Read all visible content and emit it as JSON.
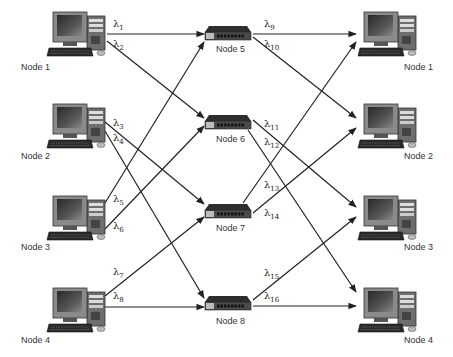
{
  "diagram": {
    "type": "optical-network-wavelength-routing",
    "source_nodes": [
      {
        "id": "src1",
        "label": "Node 1",
        "x": 75,
        "y": 38
      },
      {
        "id": "src2",
        "label": "Node 2",
        "x": 75,
        "y": 130
      },
      {
        "id": "src3",
        "label": "Node 3",
        "x": 75,
        "y": 218
      },
      {
        "id": "src4",
        "label": "Node 4",
        "x": 75,
        "y": 310
      }
    ],
    "switch_nodes": [
      {
        "id": "sw5",
        "label": "Node 5",
        "x": 227,
        "y": 35
      },
      {
        "id": "sw6",
        "label": "Node 6",
        "x": 227,
        "y": 127
      },
      {
        "id": "sw7",
        "label": "Node 7",
        "x": 227,
        "y": 212
      },
      {
        "id": "sw8",
        "label": "Node 8",
        "x": 227,
        "y": 304
      }
    ],
    "dest_nodes": [
      {
        "id": "dst1",
        "label": "Node 1",
        "x": 372,
        "y": 38
      },
      {
        "id": "dst2",
        "label": "Node 2",
        "x": 372,
        "y": 130
      },
      {
        "id": "dst3",
        "label": "Node 3",
        "x": 372,
        "y": 218
      },
      {
        "id": "dst4",
        "label": "Node 4",
        "x": 372,
        "y": 310
      }
    ],
    "links": [
      {
        "from": "src1",
        "to": "sw5",
        "label": "λ",
        "sub": "1",
        "x1": 107,
        "y1": 34,
        "x2": 204,
        "y2": 34,
        "lx": 113,
        "ly": 27
      },
      {
        "from": "src1",
        "to": "sw6",
        "label": "λ",
        "sub": "2",
        "x1": 107,
        "y1": 41,
        "x2": 204,
        "y2": 118,
        "lx": 113,
        "ly": 47
      },
      {
        "from": "src2",
        "to": "sw7",
        "label": "λ",
        "sub": "3",
        "x1": 105,
        "y1": 122,
        "x2": 204,
        "y2": 204,
        "lx": 113,
        "ly": 126
      },
      {
        "from": "src2",
        "to": "sw8",
        "label": "λ",
        "sub": "4",
        "x1": 105,
        "y1": 131,
        "x2": 204,
        "y2": 298,
        "lx": 113,
        "ly": 141
      },
      {
        "from": "src3",
        "to": "sw5",
        "label": "λ",
        "sub": "5",
        "x1": 105,
        "y1": 203,
        "x2": 204,
        "y2": 42,
        "lx": 113,
        "ly": 202
      },
      {
        "from": "src3",
        "to": "sw6",
        "label": "λ",
        "sub": "6",
        "x1": 105,
        "y1": 229,
        "x2": 204,
        "y2": 126,
        "lx": 113,
        "ly": 229
      },
      {
        "from": "src4",
        "to": "sw7",
        "label": "λ",
        "sub": "7",
        "x1": 105,
        "y1": 296,
        "x2": 204,
        "y2": 217,
        "lx": 113,
        "ly": 275
      },
      {
        "from": "src4",
        "to": "sw8",
        "label": "λ",
        "sub": "8",
        "x1": 105,
        "y1": 307,
        "x2": 204,
        "y2": 307,
        "lx": 113,
        "ly": 299
      },
      {
        "from": "sw5",
        "to": "dst1",
        "label": "λ",
        "sub": "9",
        "x1": 253,
        "y1": 34,
        "x2": 356,
        "y2": 34,
        "lx": 264,
        "ly": 27
      },
      {
        "from": "sw5",
        "to": "dst2",
        "label": "λ",
        "sub": "10",
        "x1": 253,
        "y1": 37,
        "x2": 356,
        "y2": 118,
        "lx": 264,
        "ly": 47
      },
      {
        "from": "sw6",
        "to": "dst3",
        "label": "λ",
        "sub": "11",
        "x1": 253,
        "y1": 120,
        "x2": 356,
        "y2": 207,
        "lx": 264,
        "ly": 127
      },
      {
        "from": "sw6",
        "to": "dst4",
        "label": "λ",
        "sub": "12",
        "x1": 248,
        "y1": 130,
        "x2": 356,
        "y2": 292,
        "lx": 264,
        "ly": 145
      },
      {
        "from": "sw7",
        "to": "dst1",
        "label": "λ",
        "sub": "13",
        "x1": 243,
        "y1": 203,
        "x2": 356,
        "y2": 42,
        "lx": 264,
        "ly": 188
      },
      {
        "from": "sw7",
        "to": "dst2",
        "label": "λ",
        "sub": "14",
        "x1": 253,
        "y1": 213,
        "x2": 356,
        "y2": 128,
        "lx": 264,
        "ly": 216
      },
      {
        "from": "sw8",
        "to": "dst3",
        "label": "λ",
        "sub": "15",
        "x1": 253,
        "y1": 300,
        "x2": 356,
        "y2": 217,
        "lx": 264,
        "ly": 276
      },
      {
        "from": "sw8",
        "to": "dst4",
        "label": "λ",
        "sub": "16",
        "x1": 253,
        "y1": 306,
        "x2": 356,
        "y2": 306,
        "lx": 264,
        "ly": 299
      }
    ],
    "colors": {
      "line": "#222222",
      "switch_body": "#3a3a3a",
      "switch_front": "#9a9a9a",
      "monitor": "#555555",
      "screen": "#1a1a1a",
      "tower": "#777777"
    }
  }
}
